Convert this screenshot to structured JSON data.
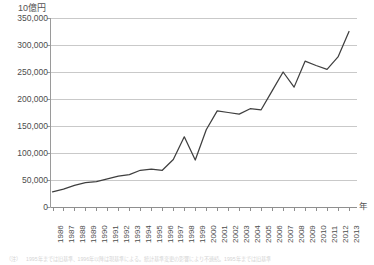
{
  "chart_data": {
    "type": "line",
    "title": "",
    "subtitle": "",
    "xlabel": "年",
    "ylabel": "10億円",
    "ylim": [
      0,
      350000
    ],
    "yticks": [
      0,
      50000,
      100000,
      150000,
      200000,
      250000,
      300000,
      350000
    ],
    "ytick_labels": [
      "0",
      "50,000",
      "100,000",
      "150,000",
      "200,000",
      "250,000",
      "300,000",
      "350,000"
    ],
    "grid": true,
    "legend": "none",
    "categories": [
      "1986",
      "1987",
      "1988",
      "1989",
      "1990",
      "1991",
      "1992",
      "1993",
      "1994",
      "1995",
      "1996",
      "1997",
      "1998",
      "1999",
      "2000",
      "2001",
      "2002",
      "2003",
      "2004",
      "2005",
      "2006",
      "2007",
      "2008",
      "2009",
      "2010",
      "2011",
      "2012",
      "2013"
    ],
    "series": [
      {
        "name": "金額",
        "color": "#3f3f3f",
        "values": [
          28000,
          33000,
          40000,
          45000,
          47000,
          52000,
          57000,
          60000,
          68000,
          70000,
          68000,
          88000,
          130000,
          87000,
          143000,
          178000,
          175000,
          172000,
          182000,
          180000,
          215000,
          250000,
          222000,
          270000,
          262000,
          255000,
          278000,
          325000
        ]
      }
    ]
  },
  "axis": {
    "y_unit_caption": "10億円",
    "x_unit_caption": "年"
  },
  "footnote": {
    "label": "（注）",
    "text": "1995年までは旧基準、1996年以降は現基準による。統計基準変更の影響により不連続。1995年までは旧基準"
  }
}
